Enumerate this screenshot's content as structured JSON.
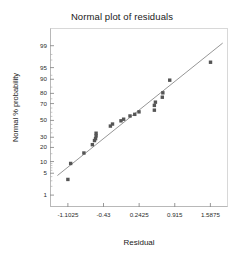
{
  "chart_data": {
    "type": "scatter",
    "title": "Normal plot of residuals",
    "xlabel": "Residual",
    "ylabel": "Normal % probability",
    "grid": false,
    "legend": null,
    "xlim": [
      -1.44,
      1.92
    ],
    "xticks": [
      -1.1025,
      -0.43,
      0.2425,
      0.915,
      1.5875
    ],
    "xtick_labels": [
      "-1.1025",
      "-0.43",
      "0.2425",
      "0.915",
      "1.5875"
    ],
    "yscale": "normal-probability",
    "ylim_pct": [
      0.35,
      99.8
    ],
    "yticks": [
      1,
      5,
      10,
      20,
      30,
      50,
      70,
      80,
      90,
      95,
      99
    ],
    "ytick_labels": [
      "1",
      "5",
      "10",
      "20",
      "30",
      "50",
      "70",
      "80",
      "90",
      "95",
      "99"
    ],
    "marker": "square",
    "marker_color": "#555555",
    "line_color": "#8a8a8a",
    "reference_line": {
      "x": [
        -1.3,
        1.82
      ],
      "y_pct": [
        4.3,
        99.2
      ]
    },
    "points": [
      {
        "x": -1.1025,
        "y_pct": 3.3
      },
      {
        "x": -1.05,
        "y_pct": 9.0
      },
      {
        "x": -0.8,
        "y_pct": 15.5
      },
      {
        "x": -0.64,
        "y_pct": 22.5
      },
      {
        "x": -0.6,
        "y_pct": 26.5
      },
      {
        "x": -0.58,
        "y_pct": 28.5
      },
      {
        "x": -0.57,
        "y_pct": 31.5
      },
      {
        "x": -0.57,
        "y_pct": 34.5
      },
      {
        "x": -0.3,
        "y_pct": 43.0
      },
      {
        "x": -0.26,
        "y_pct": 45.5
      },
      {
        "x": -0.1,
        "y_pct": 49.5
      },
      {
        "x": -0.05,
        "y_pct": 51.5
      },
      {
        "x": 0.07,
        "y_pct": 55.5
      },
      {
        "x": 0.16,
        "y_pct": 57.5
      },
      {
        "x": 0.24,
        "y_pct": 60.5
      },
      {
        "x": 0.53,
        "y_pct": 62.5
      },
      {
        "x": 0.53,
        "y_pct": 68.0
      },
      {
        "x": 0.55,
        "y_pct": 71.5
      },
      {
        "x": 0.68,
        "y_pct": 76.5
      },
      {
        "x": 0.69,
        "y_pct": 80.5
      },
      {
        "x": 0.82,
        "y_pct": 89.5
      },
      {
        "x": 1.59,
        "y_pct": 96.5
      }
    ]
  },
  "chart": {
    "title": "Normal plot of residuals",
    "xlabel": "Residual",
    "ylabel": "Normal % probability"
  }
}
